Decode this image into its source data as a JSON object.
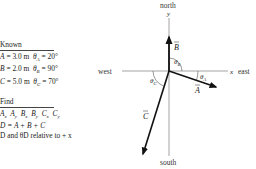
{
  "known": {
    "heading": "Known",
    "rows": [
      {
        "name": "A",
        "magnitude": "= 3.0 m",
        "angle_label": "θ",
        "angle_sub": "A",
        "angle_value": "= 20°"
      },
      {
        "name": "B",
        "magnitude": "= 2.0 m",
        "angle_label": "θ",
        "angle_sub": "B",
        "angle_value": "= 90°"
      },
      {
        "name": "C",
        "magnitude": "= 5.0 m",
        "angle_label": "θ",
        "angle_sub": "C",
        "angle_value": "= 70°"
      }
    ]
  },
  "find": {
    "heading": "Find",
    "components": [
      "A",
      "x",
      "A",
      "y",
      "B",
      "x",
      "B",
      "y",
      "C",
      "x",
      "C",
      "y"
    ],
    "components_text": "Ax Ay Bx By Cx Cy",
    "sum_equation": "D = A + B + C",
    "final": "D and θD relative to + x"
  },
  "diagram": {
    "compass": {
      "north": "north",
      "south": "south",
      "east": "east",
      "west": "west"
    },
    "axes": {
      "x": "x",
      "y": "y"
    },
    "vectors": [
      {
        "name": "A",
        "magnitude_m": 3.0,
        "angle_deg": 20,
        "angle_label": "θA",
        "direction": "20° below +x"
      },
      {
        "name": "B",
        "magnitude_m": 2.0,
        "angle_deg": 90,
        "angle_label": "θB",
        "direction": "along +y"
      },
      {
        "name": "C",
        "magnitude_m": 5.0,
        "angle_deg": 70,
        "angle_label": "θC",
        "direction": "70° below -x"
      }
    ],
    "angle_labels": {
      "A": "θ",
      "B": "θ",
      "C": "θ"
    }
  }
}
